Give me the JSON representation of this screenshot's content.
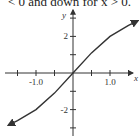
{
  "caption": "< 0 and down for x > 0.",
  "chart_data": {
    "type": "line",
    "title": "",
    "xlabel": "x",
    "ylabel": "y",
    "xlim": [
      -2.0,
      1.8
    ],
    "ylim": [
      -3.0,
      3.0
    ],
    "x_ticks": [
      -1.5,
      -1.0,
      -0.5,
      0.0,
      0.5,
      1.0,
      1.5
    ],
    "x_tick_labels": [
      {
        "value": -1.0,
        "label": "-1.0"
      },
      {
        "value": 1.0,
        "label": "1.0"
      }
    ],
    "y_ticks": [
      -3,
      -2,
      -1,
      0,
      1,
      2,
      3
    ],
    "y_tick_labels": [
      {
        "value": 2,
        "label": "2"
      },
      {
        "value": -2,
        "label": "-2"
      }
    ],
    "grid": false,
    "series": [
      {
        "name": "f(x)",
        "x": [
          -1.75,
          -1.5,
          -1.0,
          -0.5,
          0.0,
          0.5,
          1.0,
          1.5,
          1.75
        ],
        "y": [
          -2.85,
          -2.6,
          -2.0,
          -1.1,
          0.0,
          1.1,
          2.0,
          2.6,
          2.85
        ],
        "arrows_at_ends": true,
        "concavity": "up for x < 0, down for x > 0"
      }
    ]
  }
}
